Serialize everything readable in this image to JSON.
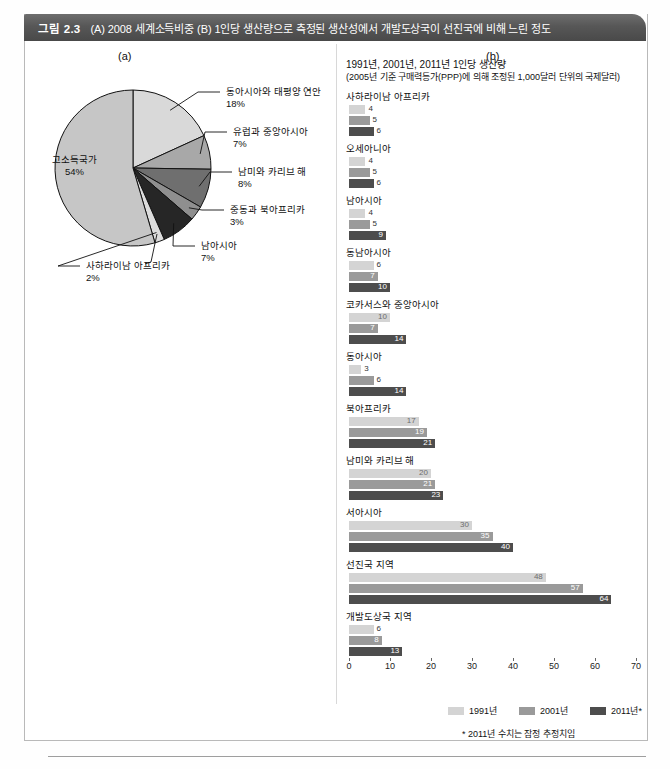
{
  "header": {
    "figure_number": "그림 2.3",
    "title": "(A) 2008 세계소득비중 (B) 1인당 생산량으로 측정된 생산성에서 개발도상국이 선진국에 비해 느린 정도"
  },
  "panels": {
    "a_label": "(a)",
    "b_label": "(b)"
  },
  "footnote": "* 2011년 수치는 잠정 추정치임",
  "colors": {
    "y1991": "#d4d4d4",
    "y2001": "#9a9a9a",
    "y2011": "#4d4d4d",
    "header_bar": "#575757"
  },
  "chart_data": [
    {
      "type": "pie",
      "title": "2008 세계소득비중",
      "categories": [
        "고소득국가",
        "동아시아와 태평양 연안",
        "유럽과 중앙아시아",
        "남미와 카리브 해",
        "중동과 북아프리카",
        "남아시아",
        "사하라이남 아프리카"
      ],
      "values": [
        54,
        18,
        7,
        8,
        3,
        7,
        2
      ],
      "labels": [
        "54%",
        "18%",
        "7%",
        "8%",
        "3%",
        "7%",
        "2%"
      ],
      "unit": "%",
      "slice_colors": [
        "#c6c6c6",
        "#d9d9d9",
        "#a8a8a8",
        "#6f6f6f",
        "#8f8f8f",
        "#262626",
        "#dcdcdc"
      ],
      "legend": "none"
    },
    {
      "type": "bar",
      "orientation": "horizontal",
      "title": "1991년, 2001년, 2011년 1인당 생산량",
      "subtitle": "(2005년 기준 구매력등가(PPP)에 의해 조정된 1,000달러 단위의 국제달러)",
      "categories": [
        "사하라이남 아프리카",
        "오세아니아",
        "남아시아",
        "동남아시아",
        "코카서스와 중앙아시아",
        "동아시아",
        "북아프리카",
        "남미와 카리브 해",
        "서아시아",
        "선진국 지역",
        "개발도상국 지역"
      ],
      "series": [
        {
          "name": "1991년",
          "values": [
            4,
            4,
            4,
            6,
            10,
            3,
            17,
            20,
            30,
            48,
            6
          ]
        },
        {
          "name": "2001년",
          "values": [
            5,
            5,
            5,
            7,
            7,
            6,
            19,
            21,
            35,
            57,
            8
          ]
        },
        {
          "name": "2011년*",
          "values": [
            6,
            6,
            9,
            10,
            14,
            14,
            21,
            23,
            40,
            64,
            13
          ]
        }
      ],
      "xlabel": "",
      "ylabel": "",
      "xlim": [
        0,
        70
      ],
      "xticks": [
        0,
        10,
        20,
        30,
        40,
        50,
        60,
        70
      ],
      "grid": false,
      "legend_position": "bottom"
    }
  ]
}
